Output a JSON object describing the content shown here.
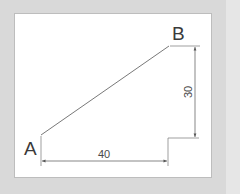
{
  "diagram": {
    "type": "dimensioned-line-drawing",
    "points": {
      "a": {
        "label": "A"
      },
      "b": {
        "label": "B"
      }
    },
    "dimensions": {
      "horizontal": {
        "value": "40"
      },
      "vertical": {
        "value": "30"
      }
    },
    "colors": {
      "background": "#d9d9d9",
      "panel": "#ffffff",
      "line": "#555555",
      "text": "#3a3a3a"
    }
  }
}
